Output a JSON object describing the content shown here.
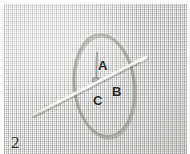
{
  "figure": {
    "number": "2",
    "medium": "photograph",
    "background_color": "#d9d9d7",
    "border_color": "#ffffff"
  },
  "labels": [
    {
      "id": "A",
      "text": "A",
      "x": 94,
      "y": 55,
      "color": "#2b2b2b"
    },
    {
      "id": "B",
      "text": "B",
      "x": 108,
      "y": 81,
      "color": "#2b2b2b"
    },
    {
      "id": "C",
      "text": "C",
      "x": 89,
      "y": 90,
      "color": "#2b2b2b"
    }
  ],
  "objects": {
    "needle": {
      "name": "sewing-needle",
      "color": "#f2f1ee",
      "from": [
        33,
        113
      ],
      "to": [
        146,
        55
      ]
    },
    "thread_loop": {
      "name": "thread-loop",
      "color": "#9a9a96",
      "center": [
        104,
        85
      ],
      "radius_x": 30,
      "radius_y": 51
    },
    "thread_tail": {
      "name": "thread-tail",
      "color": "#8f8f8b",
      "from": [
        97,
        53
      ],
      "to": [
        96,
        78
      ]
    }
  }
}
